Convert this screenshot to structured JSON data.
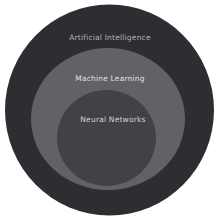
{
  "diagram": {
    "type": "nested-circles",
    "background": "#ffffff",
    "rings": [
      {
        "label": "Artificial Intelligence",
        "color": "#2d2d32",
        "label_color": "#b2b2b4"
      },
      {
        "label": "Machine Learning",
        "color": "#626266",
        "label_color": "#e0e0e0"
      },
      {
        "label": "Neural Networks",
        "color": "#414146",
        "label_color": "#d2d2d2"
      }
    ]
  }
}
